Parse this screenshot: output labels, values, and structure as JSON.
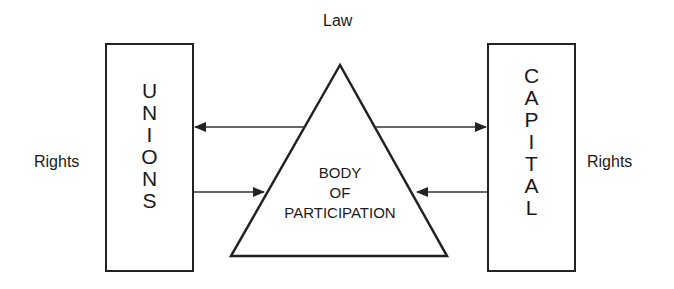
{
  "diagram": {
    "top_label": "Law",
    "left_box": {
      "label": "UNIONS",
      "letters": [
        "U",
        "N",
        "I",
        "O",
        "N",
        "S"
      ]
    },
    "right_box": {
      "label": "CAPITAL",
      "letters": [
        "C",
        "A",
        "P",
        "I",
        "T",
        "A",
        "L"
      ]
    },
    "left_side_label": "Rights",
    "right_side_label": "Rights",
    "center": {
      "line1": "BODY",
      "line2": "OF",
      "line3": "PARTICIPATION"
    },
    "arrows": [
      {
        "from": "BODY OF PARTICIPATION",
        "to": "UNIONS",
        "position": "upper"
      },
      {
        "from": "UNIONS",
        "to": "BODY OF PARTICIPATION",
        "position": "lower"
      },
      {
        "from": "BODY OF PARTICIPATION",
        "to": "CAPITAL",
        "position": "upper"
      },
      {
        "from": "CAPITAL",
        "to": "BODY OF PARTICIPATION",
        "position": "lower"
      }
    ],
    "stroke_color": "#222222"
  }
}
